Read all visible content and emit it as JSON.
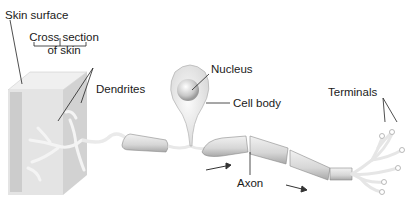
{
  "diagram": {
    "labels": {
      "skin_surface": "Skin surface",
      "cross_section_line1": "Cross section",
      "cross_section_line2": "of skin",
      "dendrites": "Dendrites",
      "nucleus": "Nucleus",
      "cell_body": "Cell body",
      "axon": "Axon",
      "terminals": "Terminals"
    },
    "colors": {
      "background": "#ffffff",
      "label_text": "#1a1a1a",
      "leader_line": "#222222",
      "tissue_light": "#e6e6e6",
      "tissue_shade": "#c8c8c8",
      "myelin": "#d4d4d4"
    }
  }
}
